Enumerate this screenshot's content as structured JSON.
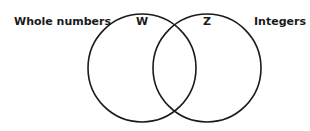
{
  "diagram": {
    "type": "venn",
    "sets": [
      {
        "id": "W",
        "symbol": "W",
        "name": "Whole numbers",
        "circle": {
          "cx": 142,
          "cy": 68,
          "r": 54
        }
      },
      {
        "id": "Z",
        "symbol": "Z",
        "name": "Integers",
        "circle": {
          "cx": 207,
          "cy": 68,
          "r": 54
        }
      }
    ],
    "stroke_color": "#1a1a1a",
    "background": "#ffffff"
  }
}
